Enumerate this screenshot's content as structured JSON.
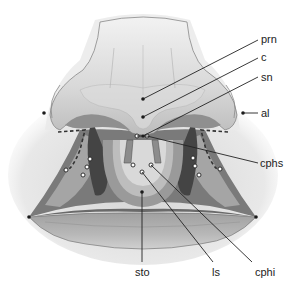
{
  "diagram": {
    "labels": {
      "prn": "prn",
      "c": "c",
      "sn": "sn",
      "al": "al",
      "cphs": "cphs",
      "cphi": "cphi",
      "ls": "ls",
      "sto": "sto"
    },
    "colors": {
      "background": "#ffffff",
      "skin_light": "#d9d9d9",
      "skin_mid": "#a9a9a9",
      "skin_dark": "#5e5e5e",
      "leader_line": "#222222",
      "landmark_dot": "#1a1a1a",
      "hollow_landmark": "#ffffff"
    }
  }
}
